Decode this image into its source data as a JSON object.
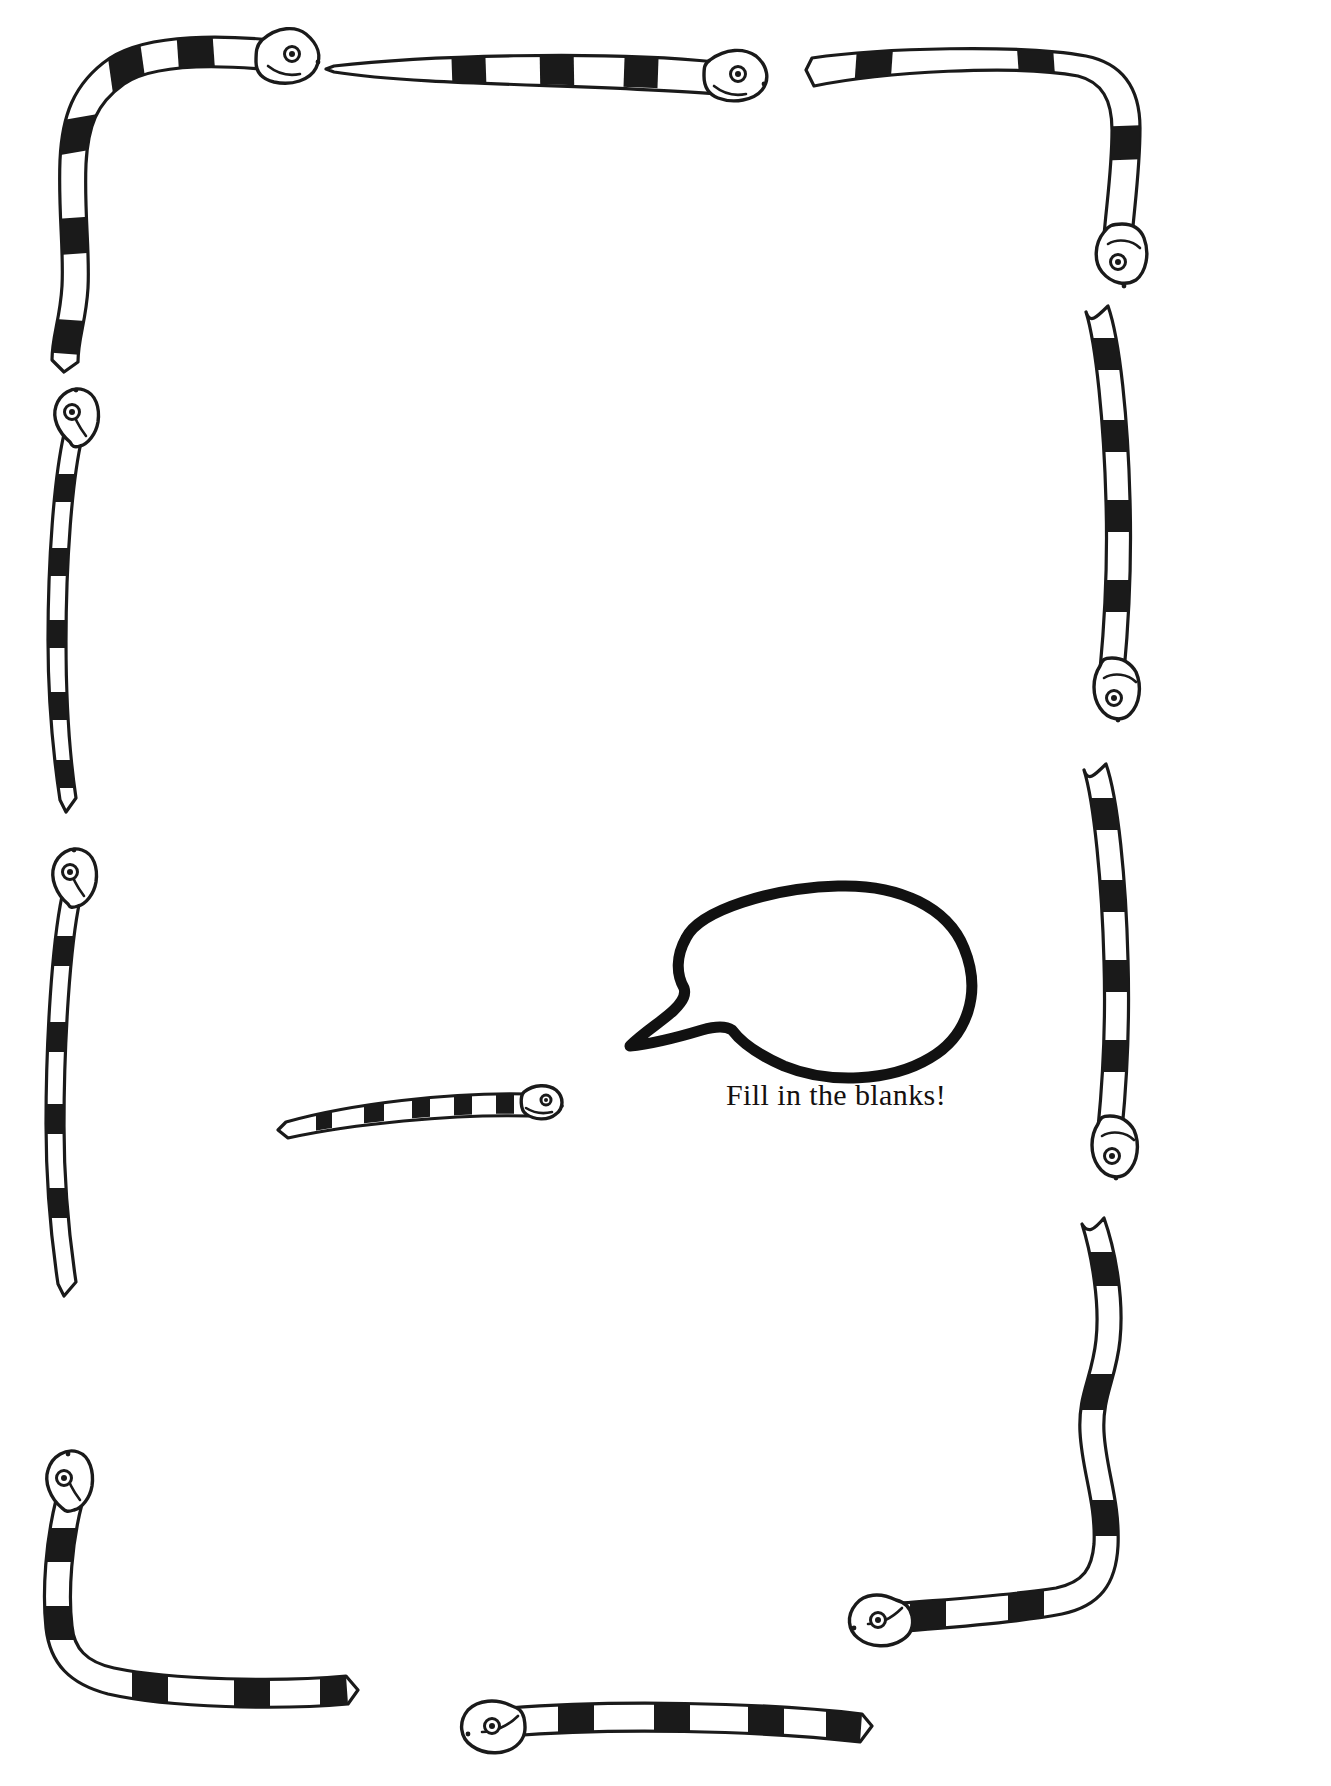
{
  "page": {
    "kind": "worksheet-border-page",
    "width": 1331,
    "height": 1786,
    "background_color": "#ffffff",
    "ink_color": "#1a1a1a",
    "writing_area_note": ""
  },
  "speech_bubble": {
    "text": "Fill in the blanks!",
    "outline_color": "#111111",
    "fill_color": "#ffffff",
    "tail_direction": "left"
  },
  "border": {
    "motif": "banded-snake",
    "snake_count": 11,
    "snakes": [
      {
        "name": "top-left-corner-snake",
        "head": "right",
        "orientation": "corner-L"
      },
      {
        "name": "top-center-snake",
        "head": "right",
        "orientation": "horizontal"
      },
      {
        "name": "top-right-corner-snake",
        "head": "down",
        "orientation": "corner-L"
      },
      {
        "name": "right-upper-snake",
        "head": "down",
        "orientation": "vertical"
      },
      {
        "name": "right-middle-snake",
        "head": "down",
        "orientation": "vertical"
      },
      {
        "name": "right-lower-snake",
        "head": "left",
        "orientation": "corner-L"
      },
      {
        "name": "left-upper-snake",
        "head": "up",
        "orientation": "vertical"
      },
      {
        "name": "left-lower-snake",
        "head": "up",
        "orientation": "vertical"
      },
      {
        "name": "bottom-left-corner-snake",
        "head": "up",
        "orientation": "corner-L"
      },
      {
        "name": "bottom-center-snake",
        "head": "left",
        "orientation": "horizontal"
      },
      {
        "name": "center-small-snake",
        "head": "right",
        "orientation": "horizontal"
      }
    ]
  }
}
